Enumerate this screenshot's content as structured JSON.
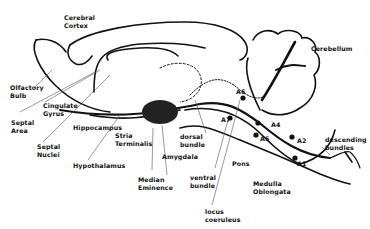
{
  "diagram": {
    "type": "sagittal brain section - noradrenergic pathways",
    "labels": {
      "cerebral_cortex": "Cerebral\nCortex",
      "cerebellum": "Cerebellum",
      "olfactory_bulb": "Olfactory\nBulb",
      "cingulate_gyrus": "Cingulate\nGyrus",
      "septal_area": "Septal\nArea",
      "septal_nuclei": "Septal\nNuclei",
      "hippocampus": "Hippocampus",
      "stria_terminalis": "Stria\nTerminalis",
      "hypothalamus": "Hypothalamus",
      "amygdala": "Amygdala",
      "median_eminence": "Median\nEminence",
      "dorsal_bundle": "dorsal\nbundle",
      "ventral_bundle": "ventral\nbundle",
      "locus_coeruleus": "locus\ncoeruleus",
      "pons": "Pons",
      "medulla_oblongata": "Medulla\nOblongata",
      "descending_bundles": "descending\nbundles",
      "a1": "A1",
      "a2": "A2",
      "a4": "A4",
      "a5": "A5",
      "a6": "A6",
      "a7": "A7"
    },
    "colors": {
      "ink": "#111111",
      "background": "#ffffff",
      "leader": "#555555"
    }
  }
}
